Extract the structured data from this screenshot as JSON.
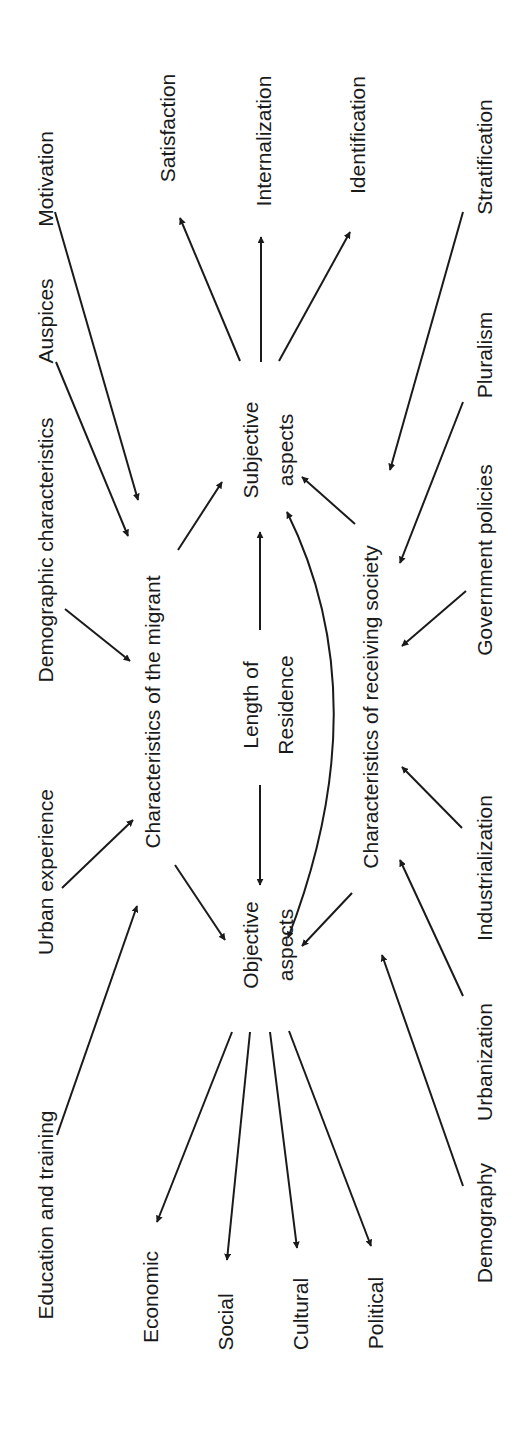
{
  "diagram": {
    "orientation": "rotated -90deg",
    "colors": {
      "ink": "#1a1a1a",
      "background": "#ffffff"
    },
    "nodes": {
      "education": {
        "label": "Education and training",
        "x": 45,
        "y": 1215
      },
      "urban_exp": {
        "label": "Urban experience",
        "x": 45,
        "y": 872
      },
      "demographic_char": {
        "label": "Demographic characteristics",
        "x": 45,
        "y": 550
      },
      "auspices": {
        "label": "Auspices",
        "x": 45,
        "y": 321
      },
      "motivation": {
        "label": "Motivation",
        "x": 45,
        "y": 179
      },
      "char_migrant": {
        "label": "Characteristics of the migrant",
        "x": 152,
        "y": 712
      },
      "satisfaction": {
        "label": "Satisfaction",
        "x": 167,
        "y": 128
      },
      "internalization": {
        "label": "Internalization",
        "x": 263,
        "y": 141
      },
      "identification": {
        "label": "Identification",
        "x": 357,
        "y": 135
      },
      "subjective_1": {
        "label": "Subjective",
        "x": 250,
        "y": 450
      },
      "subjective_2": {
        "label": "aspects",
        "x": 285,
        "y": 450
      },
      "length_1": {
        "label": "Length of",
        "x": 250,
        "y": 705
      },
      "length_2": {
        "label": "Residence",
        "x": 285,
        "y": 705
      },
      "objective_1": {
        "label": "Objective",
        "x": 250,
        "y": 945
      },
      "objective_2": {
        "label": "aspects",
        "x": 285,
        "y": 945
      },
      "char_society": {
        "label": "Characteristics of receiving society",
        "x": 370,
        "y": 707
      },
      "stratification": {
        "label": "Stratification",
        "x": 484,
        "y": 157
      },
      "pluralism": {
        "label": "Pluralism",
        "x": 484,
        "y": 355
      },
      "gov_policies": {
        "label": "Government policies",
        "x": 484,
        "y": 560
      },
      "industrialization": {
        "label": "Industrialization",
        "x": 484,
        "y": 868
      },
      "urbanization": {
        "label": "Urbanization",
        "x": 484,
        "y": 1062
      },
      "demography": {
        "label": "Demography",
        "x": 484,
        "y": 1223
      },
      "economic": {
        "label": "Economic",
        "x": 150,
        "y": 1297
      },
      "social": {
        "label": "Social",
        "x": 225,
        "y": 1322
      },
      "cultural": {
        "label": "Cultural",
        "x": 300,
        "y": 1314
      },
      "political": {
        "label": "Political",
        "x": 375,
        "y": 1313
      }
    },
    "edges": [
      {
        "from": "education",
        "to": "char_migrant",
        "x1": 57,
        "y1": 1135,
        "x2": 137,
        "y2": 906
      },
      {
        "from": "urban_exp",
        "to": "char_migrant",
        "x1": 62,
        "y1": 888,
        "x2": 133,
        "y2": 820
      },
      {
        "from": "demographic_char",
        "to": "char_migrant",
        "x1": 65,
        "y1": 609,
        "x2": 130,
        "y2": 661
      },
      {
        "from": "auspices",
        "to": "char_migrant",
        "x1": 56,
        "y1": 362,
        "x2": 128,
        "y2": 536
      },
      {
        "from": "motivation",
        "to": "char_migrant",
        "x1": 55,
        "y1": 212,
        "x2": 138,
        "y2": 500
      },
      {
        "from": "char_migrant",
        "to": "subjective",
        "x1": 178,
        "y1": 550,
        "x2": 222,
        "y2": 482
      },
      {
        "from": "char_migrant",
        "to": "objective",
        "x1": 175,
        "y1": 865,
        "x2": 225,
        "y2": 940
      },
      {
        "from": "subjective",
        "to": "satisfaction",
        "x1": 240,
        "y1": 361,
        "x2": 180,
        "y2": 218
      },
      {
        "from": "subjective",
        "to": "internalization",
        "x1": 261,
        "y1": 362,
        "x2": 261,
        "y2": 237
      },
      {
        "from": "subjective",
        "to": "identification",
        "x1": 279,
        "y1": 361,
        "x2": 350,
        "y2": 232
      },
      {
        "from": "length",
        "to": "subjective",
        "x1": 260,
        "y1": 630,
        "x2": 260,
        "y2": 532
      },
      {
        "from": "length",
        "to": "objective",
        "x1": 260,
        "y1": 785,
        "x2": 260,
        "y2": 885
      },
      {
        "from": "char_society",
        "to": "subjective",
        "x1": 355,
        "y1": 524,
        "x2": 302,
        "y2": 477
      },
      {
        "from": "char_society",
        "to": "objective",
        "x1": 352,
        "y1": 893,
        "x2": 302,
        "y2": 946
      },
      {
        "from": "stratification",
        "to": "char_society",
        "x1": 463,
        "y1": 212,
        "x2": 390,
        "y2": 470
      },
      {
        "from": "pluralism",
        "to": "char_society",
        "x1": 463,
        "y1": 402,
        "x2": 400,
        "y2": 563
      },
      {
        "from": "gov_policies",
        "to": "char_society",
        "x1": 466,
        "y1": 591,
        "x2": 402,
        "y2": 646
      },
      {
        "from": "industrialization",
        "to": "char_society",
        "x1": 462,
        "y1": 828,
        "x2": 402,
        "y2": 767
      },
      {
        "from": "urbanization",
        "to": "char_society",
        "x1": 463,
        "y1": 996,
        "x2": 400,
        "y2": 860
      },
      {
        "from": "demography",
        "to": "char_society",
        "x1": 463,
        "y1": 1186,
        "x2": 382,
        "y2": 955
      },
      {
        "from": "objective",
        "to": "economic",
        "x1": 232,
        "y1": 1032,
        "x2": 157,
        "y2": 1222
      },
      {
        "from": "objective",
        "to": "social",
        "x1": 250,
        "y1": 1032,
        "x2": 227,
        "y2": 1260
      },
      {
        "from": "objective",
        "to": "cultural",
        "x1": 270,
        "y1": 1032,
        "x2": 297,
        "y2": 1248
      },
      {
        "from": "objective",
        "to": "political",
        "x1": 289,
        "y1": 1031,
        "x2": 371,
        "y2": 1246
      }
    ],
    "curved_edge": {
      "from": "objective",
      "to": "subjective",
      "bidirectional": true,
      "d": "M 288 938 Q 380 700 287 512"
    }
  }
}
